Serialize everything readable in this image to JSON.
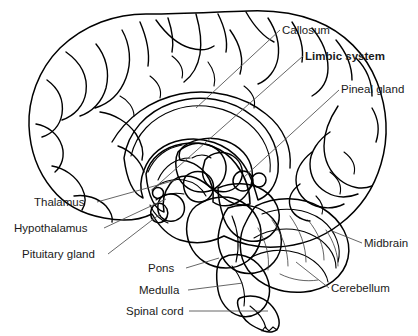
{
  "figure": {
    "type": "anatomical-illustration",
    "background_color": "#ffffff",
    "width": 418,
    "height": 336
  },
  "palette": {
    "background": "#ffffff",
    "cortex_gray": "#a9a9a9",
    "cortex_gray_dark": "#8e8e8e",
    "corpus_callosum_gray": "#9a9a9a",
    "interior_white": "#fbfbfb",
    "interior_light": "#e6e6e6",
    "brainstem_dark": "#141414",
    "brainstem_mid": "#6e6e6e",
    "cerebellum_gray": "#999999",
    "cerebellum_highlight": "#f2f2f2",
    "outline_black": "#000000",
    "leader_line": "#555555",
    "text_color": "#1a1a1a"
  },
  "labels": [
    {
      "id": "callosum",
      "text": "Callosum",
      "bold": false,
      "x": 282,
      "y": 34,
      "anchor": "start",
      "leader": [
        [
          280,
          30
        ],
        [
          196,
          108
        ]
      ]
    },
    {
      "id": "limbic-system",
      "text": "Limbic system",
      "bold": true,
      "x": 305,
      "y": 60,
      "anchor": "start",
      "leader": [
        [
          303,
          56
        ],
        [
          152,
          190
        ]
      ]
    },
    {
      "id": "pineal-gland",
      "text": "Pineal gland",
      "bold": false,
      "x": 341,
      "y": 93,
      "anchor": "start",
      "leader": [
        [
          339,
          90
        ],
        [
          243,
          178
        ]
      ]
    },
    {
      "id": "midbrain",
      "text": "Midbrain",
      "bold": false,
      "x": 364,
      "y": 247,
      "anchor": "start",
      "leader": [
        [
          362,
          243
        ],
        [
          332,
          231
        ]
      ]
    },
    {
      "id": "cerebellum",
      "text": "Cerebellum",
      "bold": false,
      "x": 331,
      "y": 292,
      "anchor": "start",
      "leader": [
        [
          329,
          288
        ],
        [
          296,
          262
        ]
      ]
    },
    {
      "id": "thalamus",
      "text": "Thalamus",
      "bold": false,
      "x": 34,
      "y": 206,
      "anchor": "start",
      "leader": [
        [
          97,
          202
        ],
        [
          176,
          180
        ]
      ]
    },
    {
      "id": "hypothalamus",
      "text": "Hypothalamus",
      "bold": false,
      "x": 14,
      "y": 232,
      "anchor": "start",
      "leader": [
        [
          104,
          228
        ],
        [
          166,
          199
        ]
      ]
    },
    {
      "id": "pituitary-gland",
      "text": "Pituitary gland",
      "bold": false,
      "x": 22,
      "y": 258,
      "anchor": "start",
      "leader": [
        [
          108,
          254
        ],
        [
          160,
          214
        ]
      ]
    },
    {
      "id": "pons",
      "text": "Pons",
      "bold": false,
      "x": 148,
      "y": 272,
      "anchor": "start",
      "leader": [
        [
          186,
          268
        ],
        [
          219,
          258
        ]
      ]
    },
    {
      "id": "medulla",
      "text": "Medulla",
      "bold": false,
      "x": 139,
      "y": 294,
      "anchor": "start",
      "leader": [
        [
          188,
          290
        ],
        [
          243,
          283
        ]
      ]
    },
    {
      "id": "spinal-cord",
      "text": "Spinal cord",
      "bold": false,
      "x": 126,
      "y": 315,
      "anchor": "start",
      "leader": [
        [
          189,
          311
        ],
        [
          268,
          311
        ]
      ]
    }
  ],
  "structures": [
    {
      "id": "cerebral-cortex",
      "name": "Cerebral cortex"
    },
    {
      "id": "corpus-callosum",
      "name": "Corpus callosum"
    },
    {
      "id": "thalamus-body",
      "name": "Thalamus"
    },
    {
      "id": "hypothalamus-body",
      "name": "Hypothalamus"
    },
    {
      "id": "pituitary-body",
      "name": "Pituitary gland"
    },
    {
      "id": "pineal-body",
      "name": "Pineal gland"
    },
    {
      "id": "midbrain-body",
      "name": "Midbrain"
    },
    {
      "id": "pons-body",
      "name": "Pons"
    },
    {
      "id": "medulla-body",
      "name": "Medulla"
    },
    {
      "id": "spinal-cord-body",
      "name": "Spinal cord"
    },
    {
      "id": "cerebellum-body",
      "name": "Cerebellum"
    }
  ]
}
